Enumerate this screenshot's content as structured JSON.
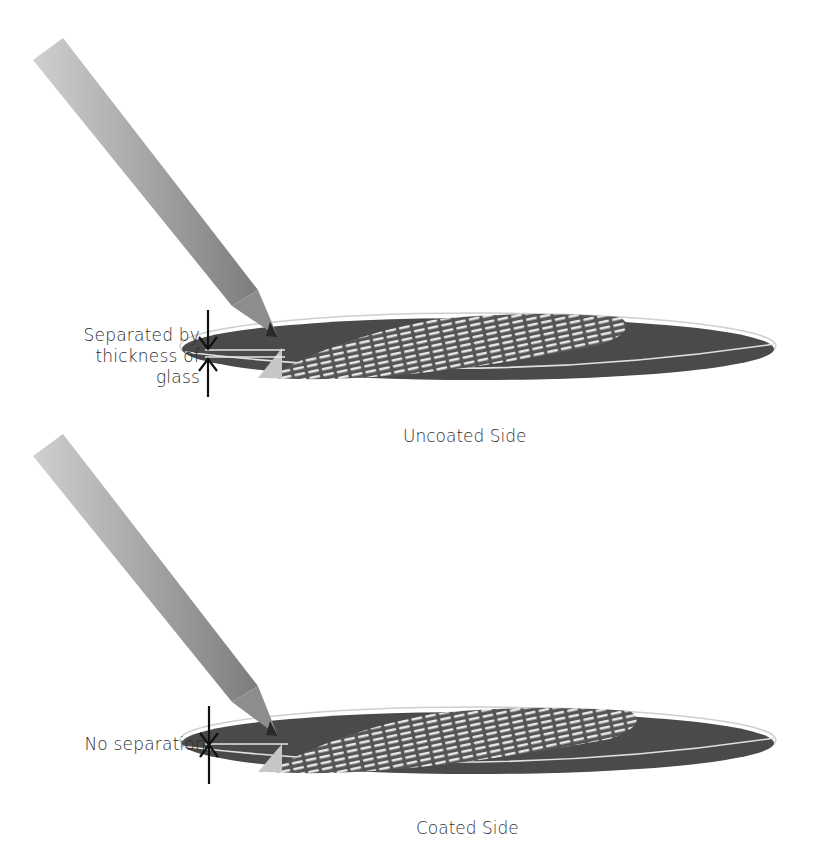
{
  "diagram": {
    "panels": [
      {
        "id": "uncoated",
        "caption": "Uncoated Side",
        "annotation_lines": [
          "Separated by",
          "thickness of",
          "glass"
        ],
        "description": "Pencil tip touching top surface; reflection appears separated by the glass thickness"
      },
      {
        "id": "coated",
        "caption": "Coated Side",
        "annotation_lines": [
          "No separation"
        ],
        "description": "Pencil tip touching coated surface; reflection has no separation"
      }
    ],
    "colors": {
      "background": "#ffffff",
      "disc_fill": "#4a4a4a",
      "disc_rim": "#d8d8d8",
      "pencil_body": "#a8a8a8",
      "pencil_tip": "#8a8a8a",
      "arrow": "#111111",
      "text": "#2b2b2b"
    }
  }
}
